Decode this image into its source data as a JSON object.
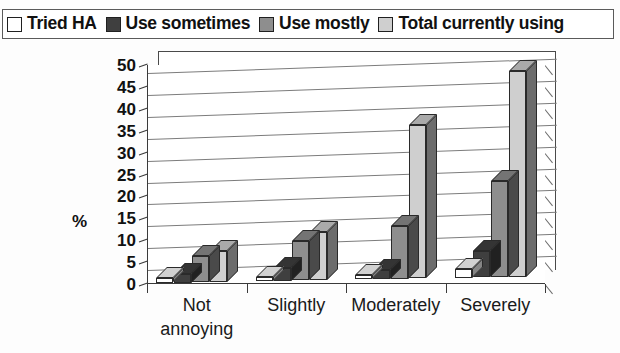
{
  "legend": {
    "items": [
      {
        "label": "Tried HA",
        "color": "#ffffff",
        "swatch_icon": "legend-swatch-icon"
      },
      {
        "label": "Use sometimes",
        "color": "#3f3f3f",
        "swatch_icon": "legend-swatch-icon"
      },
      {
        "label": "Use mostly",
        "color": "#8e8e8e",
        "swatch_icon": "legend-swatch-icon"
      },
      {
        "label": "Total currently using",
        "color": "#cfcfcf",
        "swatch_icon": "legend-swatch-icon"
      }
    ]
  },
  "axes": {
    "y_title": "%",
    "y_ticks": [
      "50",
      "45",
      "40",
      "35",
      "30",
      "25",
      "20",
      "15",
      "10",
      "5",
      "0"
    ],
    "x_labels": [
      "Not\nannoying",
      "Slightly",
      "Moderately",
      "Severely"
    ]
  },
  "chart_data": {
    "type": "bar",
    "title": "",
    "subtitle": "",
    "xlabel": "",
    "ylabel": "%",
    "ylim": [
      0,
      50
    ],
    "ytick_step": 5,
    "grid": true,
    "legend_position": "top",
    "style": "3d-clustered-column",
    "categories": [
      "Not annoying",
      "Slightly",
      "Moderately",
      "Severely"
    ],
    "series": [
      {
        "name": "Tried HA",
        "color": "#ffffff",
        "values": [
          1,
          1,
          1,
          2
        ]
      },
      {
        "name": "Use sometimes",
        "color": "#3f3f3f",
        "values": [
          2,
          3,
          2,
          6
        ]
      },
      {
        "name": "Use mostly",
        "color": "#8e8e8e",
        "values": [
          6,
          9,
          12,
          22
        ]
      },
      {
        "name": "Total currently using",
        "color": "#cfcfcf",
        "values": [
          7,
          11,
          35,
          47
        ]
      }
    ],
    "annotations": []
  }
}
